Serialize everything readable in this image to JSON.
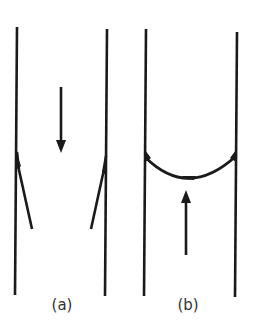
{
  "diagram": {
    "stroke_color": "#1a1a1a",
    "panels": [
      {
        "id": "a",
        "label": "(a)",
        "description": "Two valve flaps open along vessel walls, flow arrow pointing downward"
      },
      {
        "id": "b",
        "label": "(b)",
        "description": "Valve cusps closed forming a curved seal across vessel, backflow arrow pointing upward"
      }
    ]
  }
}
